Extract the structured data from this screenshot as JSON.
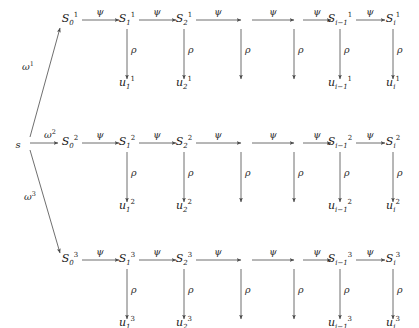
{
  "figure": {
    "kind": "commutative-diagram",
    "background_color": "#ffffff",
    "line_color": "#4a4a4a",
    "text_color": "#1a1a1a"
  },
  "root": {
    "label": "s",
    "x": 18,
    "y": 140
  },
  "branch_edges": [
    {
      "name": "omega-1",
      "label": "ω",
      "superscript": "1",
      "from_x": 30,
      "from_y": 137,
      "to_x": 60,
      "to_y": 28,
      "label_x": 22,
      "label_y": 62
    },
    {
      "name": "omega-2",
      "label": "ω",
      "superscript": "2",
      "from_x": 30,
      "from_y": 143,
      "to_x": 58,
      "to_y": 143,
      "label_x": 44,
      "label_y": 130
    },
    {
      "name": "omega-3",
      "label": "ω",
      "superscript": "3",
      "from_x": 30,
      "from_y": 150,
      "to_x": 60,
      "to_y": 253,
      "label_x": 24,
      "label_y": 192
    }
  ],
  "rows": [
    {
      "index": 1,
      "superscript": "1",
      "baseline_y": 24,
      "arrow_y": 20,
      "rho_top_y": 29,
      "rho_bottom_y": 79,
      "u_y": 85
    },
    {
      "index": 2,
      "superscript": "2",
      "baseline_y": 147,
      "arrow_y": 143,
      "rho_top_y": 152,
      "rho_bottom_y": 202,
      "u_y": 208
    },
    {
      "index": 3,
      "superscript": "3",
      "baseline_y": 264,
      "arrow_y": 260,
      "rho_top_y": 269,
      "rho_bottom_y": 319,
      "u_y": 325
    }
  ],
  "columns": [
    {
      "name": "col-0",
      "x": 70,
      "s_sub": "0",
      "u_sub": null,
      "has_node": true,
      "has_rho": false
    },
    {
      "name": "col-1",
      "x": 127,
      "s_sub": "1",
      "u_sub": "1",
      "has_node": true,
      "has_rho": true
    },
    {
      "name": "col-2",
      "x": 184,
      "s_sub": "2",
      "u_sub": "2",
      "has_node": true,
      "has_rho": true
    },
    {
      "name": "col-3",
      "x": 241,
      "s_sub": null,
      "u_sub": null,
      "has_node": false,
      "has_rho": true
    },
    {
      "name": "col-4",
      "x": 294,
      "s_sub": null,
      "u_sub": null,
      "has_node": false,
      "has_rho": true
    },
    {
      "name": "col-5",
      "x": 340,
      "s_sub": "i−1",
      "u_sub": "i−1",
      "has_node": true,
      "has_rho": true
    },
    {
      "name": "col-6",
      "x": 393,
      "s_sub": "i",
      "u_sub": "i",
      "has_node": true,
      "has_rho": true
    }
  ],
  "horizontal_arrows": [
    {
      "name": "psi-0-1",
      "x1": 82,
      "x2": 119,
      "label_x": 100
    },
    {
      "name": "psi-1-2",
      "x1": 139,
      "x2": 176,
      "label_x": 157
    },
    {
      "name": "psi-2-3",
      "x1": 196,
      "x2": 241,
      "label_x": 218
    },
    {
      "name": "psi-3-4",
      "x1": 252,
      "x2": 294,
      "label_x": 273
    },
    {
      "name": "psi-4-5",
      "x1": 303,
      "x2": 331,
      "label_x": 317
    },
    {
      "name": "psi-5-6",
      "x1": 356,
      "x2": 385,
      "label_x": 370
    }
  ],
  "symbols": {
    "state": "S",
    "observation": "u",
    "transition": "ψ",
    "emission": "ρ",
    "branch": "ω"
  },
  "labels": {
    "psi": "ψ",
    "rho": "ρ"
  }
}
